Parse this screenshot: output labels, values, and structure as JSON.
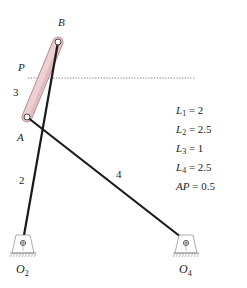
{
  "diagram": {
    "type": "four-bar linkage",
    "points": {
      "B": "B",
      "P": "P",
      "A": "A",
      "O2": {
        "base": "O",
        "sub": "2"
      },
      "O4": {
        "base": "O",
        "sub": "4"
      }
    },
    "links": {
      "link2": "2",
      "link3": "3",
      "link4": "4"
    },
    "parameters": [
      {
        "var": "L",
        "sub": "1",
        "eq": " = 2"
      },
      {
        "var": "L",
        "sub": "2",
        "eq": " = 2.5"
      },
      {
        "var": "L",
        "sub": "3",
        "eq": " = 1"
      },
      {
        "var": "L",
        "sub": "4",
        "eq": " = 2.5"
      },
      {
        "var": "AP",
        "sub": "",
        "eq": " = 0.5"
      }
    ],
    "colors": {
      "link": "#1a1a1a",
      "coupler_fill": "#e9c9cc",
      "coupler_stroke": "#b98a90",
      "ground": "#8a8a8a",
      "text": "#231f20"
    }
  }
}
